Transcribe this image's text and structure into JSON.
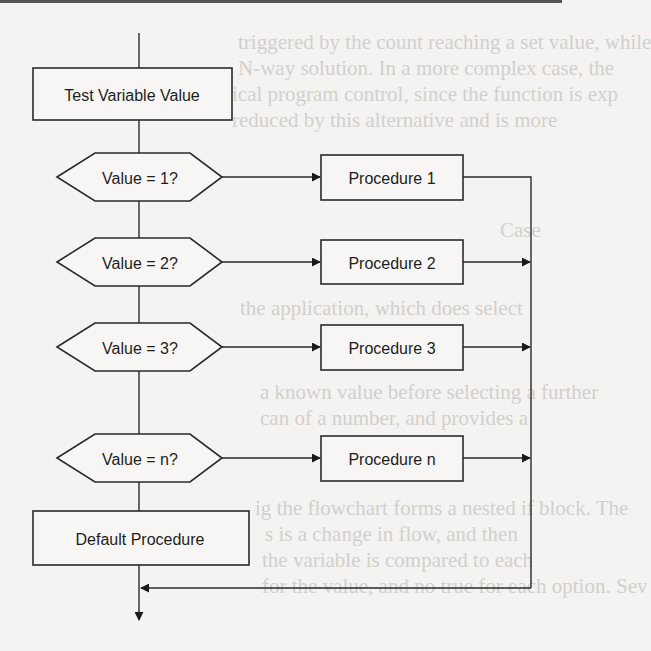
{
  "diagram": {
    "type": "flowchart",
    "start_box": {
      "label": "Test Variable Value"
    },
    "decisions": [
      {
        "label": "Value = 1?",
        "target": "Procedure 1"
      },
      {
        "label": "Value = 2?",
        "target": "Procedure 2"
      },
      {
        "label": "Value = 3?",
        "target": "Procedure 3"
      },
      {
        "label": "Value = n?",
        "target": "Procedure n"
      }
    ],
    "procedures": [
      {
        "label": "Procedure 1"
      },
      {
        "label": "Procedure 2"
      },
      {
        "label": "Procedure 3"
      },
      {
        "label": "Procedure n"
      }
    ],
    "default_box": {
      "label": "Default Procedure"
    }
  },
  "background_bleed": {
    "lines": [
      "triggered by the count reaching a set value, while",
      "N-way solution. In a more complex case, the",
      "ical program control, since the function is exp",
      "reduced by this alternative and is more",
      "Case",
      "the application, which does select",
      "a",
      "a known value before selecting a further",
      "can of a number, and provides a",
      "ic the",
      "ig the flowchart forms a nested if block. The",
      "s is a change in flow, and then",
      "the variable is compared to each",
      "for the value, and no true for each option. Sev"
    ]
  }
}
